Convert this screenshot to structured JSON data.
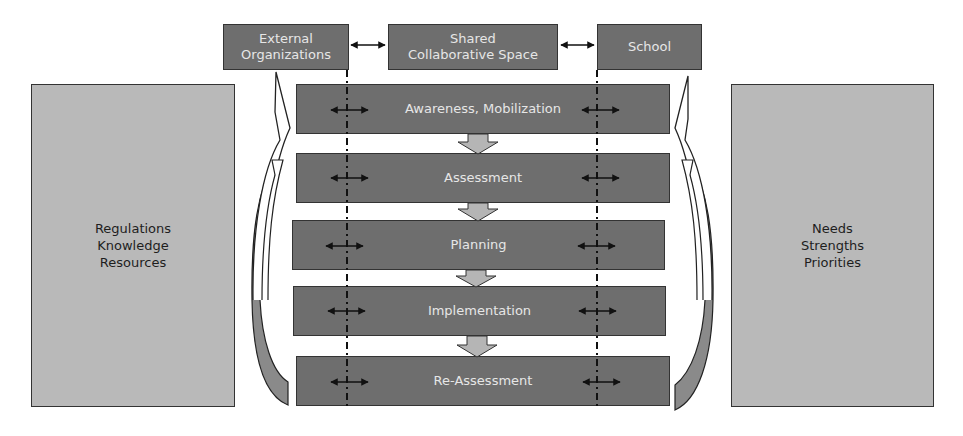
{
  "top_entities": [
    {
      "id": "external",
      "label": "External\nOrganizations"
    },
    {
      "id": "shared",
      "label": "Shared\nCollaborative Space"
    },
    {
      "id": "school",
      "label": "School"
    }
  ],
  "side_panels": {
    "left": {
      "label": "Regulations\nKnowledge\nResources"
    },
    "right": {
      "label": "Needs\nStrengths\nPriorities"
    }
  },
  "process_steps": [
    {
      "label": "Awareness, Mobilization"
    },
    {
      "label": "Assessment"
    },
    {
      "label": "Planning"
    },
    {
      "label": "Implementation"
    },
    {
      "label": "Re-Assessment"
    }
  ],
  "colors": {
    "dark_box_fill": "#6e6e6e",
    "light_box_fill": "#b9b9b9",
    "down_arrow_fill": "#b5b5b5",
    "outline": "#333333",
    "dark_text": "#e6e6e6",
    "light_text": "#1e1e1e"
  }
}
